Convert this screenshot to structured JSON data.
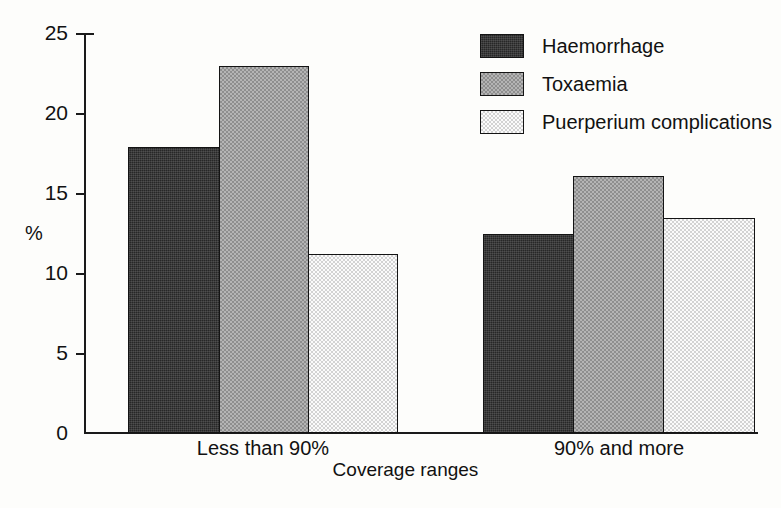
{
  "chart_data": {
    "type": "bar",
    "title": "",
    "xlabel": "Coverage ranges",
    "ylabel": "%",
    "categories": [
      "Less than 90%",
      "90% and more"
    ],
    "series": [
      {
        "name": "Haemorrhage",
        "values": [
          17.9,
          12.5
        ],
        "swatch": "dark"
      },
      {
        "name": "Toxaemia",
        "values": [
          23.0,
          16.1
        ],
        "swatch": "mid"
      },
      {
        "name": "Puerperium complications",
        "values": [
          11.2,
          13.5
        ],
        "swatch": "light"
      }
    ],
    "ylim": [
      0,
      25
    ],
    "yticks": [
      0,
      5,
      10,
      15,
      20,
      25
    ],
    "ytick_labels": [
      "0",
      "5",
      "10",
      "15",
      "20",
      "25"
    ],
    "grid": false,
    "legend_position": "top-right",
    "colors": {
      "dark": "#272727",
      "mid": "#a0a0a0",
      "light": "#f2f2f2",
      "axis": "#1a1a1a",
      "background": "#fdfdfb"
    }
  },
  "legend": {
    "entries": [
      {
        "label": "Haemorrhage"
      },
      {
        "label": "Toxaemia"
      },
      {
        "label": "Puerperium complications"
      }
    ]
  }
}
